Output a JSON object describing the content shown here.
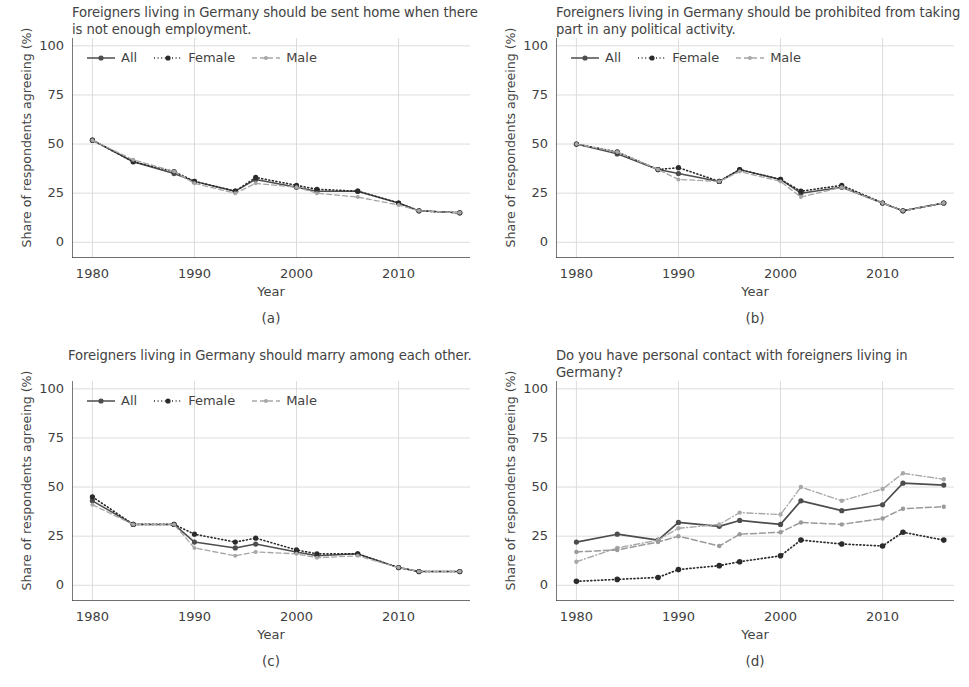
{
  "figure": {
    "y_axis_label": "Share of respondents agreeing (%)",
    "x_axis_label": "Year",
    "y_ticks": [
      "0",
      "25",
      "50",
      "75",
      "100"
    ],
    "x_ticks": [
      "1980",
      "1990",
      "2000",
      "2010"
    ],
    "colors": {
      "all": "#4d4d4d",
      "female": "#2b2b2b",
      "male": "#a6a6a6",
      "workplace": "#4d4d4d",
      "family": "#2b2b2b",
      "friendsgroup": "#a8a8a8",
      "neighborhood": "#9a9a9a",
      "grid": "#d8d8d8",
      "axis": "#404040",
      "text": "#434343"
    }
  },
  "panels": [
    {
      "id": "a",
      "caption": "(a)",
      "title": "Foreigners living in Germany should be sent home when there is not enough employment.",
      "legend": [
        {
          "label": "All",
          "style": "solid",
          "marker": "dot"
        },
        {
          "label": "Female",
          "style": "dotted",
          "marker": "dot"
        },
        {
          "label": "Male",
          "style": "dashed",
          "marker": "dot"
        }
      ]
    },
    {
      "id": "b",
      "caption": "(b)",
      "title": "Foreigners living in Germany should be prohibited from taking part in any political activity.",
      "legend": [
        {
          "label": "All",
          "style": "solid",
          "marker": "dot"
        },
        {
          "label": "Female",
          "style": "dotted",
          "marker": "dot"
        },
        {
          "label": "Male",
          "style": "dashed",
          "marker": "dot"
        }
      ]
    },
    {
      "id": "c",
      "caption": "(c)",
      "title": "Foreigners living in Germany should marry among each other.",
      "legend": [
        {
          "label": "All",
          "style": "solid",
          "marker": "dot"
        },
        {
          "label": "Female",
          "style": "dotted",
          "marker": "dot"
        },
        {
          "label": "Male",
          "style": "dashed",
          "marker": "dot"
        }
      ]
    },
    {
      "id": "d",
      "caption": "(d)",
      "title": "Do you have personal contact with foreigners living in Germany?",
      "legend": [
        {
          "label": "At the Workplace",
          "style": "solid",
          "marker": "dot"
        },
        {
          "label": "In the Family",
          "style": "dotted",
          "marker": "dot"
        },
        {
          "label": "In the Friendsgroup",
          "style": "dashdot",
          "marker": "dot"
        },
        {
          "label": "In the Neighborhood",
          "style": "dashed",
          "marker": "dot"
        }
      ]
    }
  ],
  "chart_data": [
    {
      "type": "line",
      "panel": "a",
      "title": "Foreigners living in Germany should be sent home when there is not enough employment.",
      "xlabel": "Year",
      "ylabel": "Share of respondents agreeing (%)",
      "xlim": [
        1978,
        2017
      ],
      "ylim": [
        -8,
        104
      ],
      "yticks": [
        0,
        25,
        50,
        75,
        100
      ],
      "xticks": [
        1980,
        1990,
        2000,
        2010
      ],
      "grid": true,
      "legend_position": "top-left",
      "x": [
        1980,
        1984,
        1988,
        1990,
        1994,
        1996,
        2000,
        2002,
        2006,
        2010,
        2012,
        2016
      ],
      "series": [
        {
          "name": "All",
          "values": [
            52,
            41,
            35,
            31,
            26,
            32,
            28,
            26,
            26,
            20,
            16,
            15
          ]
        },
        {
          "name": "Female",
          "values": [
            52,
            41,
            36,
            31,
            26,
            33,
            29,
            27,
            26,
            20,
            16,
            15
          ]
        },
        {
          "name": "Male",
          "values": [
            52,
            42,
            36,
            30,
            25,
            30,
            28,
            25,
            23,
            19,
            16,
            15
          ]
        }
      ]
    },
    {
      "type": "line",
      "panel": "b",
      "title": "Foreigners living in Germany should be prohibited from taking part in any political activity.",
      "xlabel": "Year",
      "ylabel": "Share of respondents agreeing (%)",
      "xlim": [
        1978,
        2017
      ],
      "ylim": [
        -8,
        104
      ],
      "yticks": [
        0,
        25,
        50,
        75,
        100
      ],
      "xticks": [
        1980,
        1990,
        2000,
        2010
      ],
      "grid": true,
      "legend_position": "top-left",
      "x": [
        1980,
        1984,
        1988,
        1990,
        1994,
        1996,
        2000,
        2002,
        2006,
        2010,
        2012,
        2016
      ],
      "series": [
        {
          "name": "All",
          "values": [
            50,
            45,
            37,
            35,
            31,
            37,
            32,
            25,
            28,
            20,
            16,
            20
          ]
        },
        {
          "name": "Female",
          "values": [
            50,
            46,
            37,
            38,
            31,
            37,
            32,
            26,
            29,
            20,
            16,
            20
          ]
        },
        {
          "name": "Male",
          "values": [
            50,
            46,
            37,
            32,
            31,
            36,
            31,
            23,
            28,
            20,
            16,
            20
          ]
        }
      ]
    },
    {
      "type": "line",
      "panel": "c",
      "title": "Foreigners living in Germany should marry among each other.",
      "xlabel": "Year",
      "ylabel": "Share of respondents agreeing (%)",
      "xlim": [
        1978,
        2017
      ],
      "ylim": [
        -8,
        104
      ],
      "yticks": [
        0,
        25,
        50,
        75,
        100
      ],
      "xticks": [
        1980,
        1990,
        2000,
        2010
      ],
      "grid": true,
      "legend_position": "top-left",
      "x": [
        1980,
        1984,
        1988,
        1990,
        1994,
        1996,
        2000,
        2002,
        2006,
        2010,
        2012,
        2016
      ],
      "series": [
        {
          "name": "All",
          "values": [
            43,
            31,
            31,
            22,
            19,
            21,
            17,
            15,
            16,
            9,
            7,
            7
          ]
        },
        {
          "name": "Female",
          "values": [
            45,
            31,
            31,
            26,
            22,
            24,
            18,
            16,
            16,
            9,
            7,
            7
          ]
        },
        {
          "name": "Male",
          "values": [
            41,
            31,
            31,
            19,
            15,
            17,
            16,
            14,
            15,
            9,
            7,
            7
          ]
        }
      ]
    },
    {
      "type": "line",
      "panel": "d",
      "title": "Do you have personal contact with foreigners living in Germany?",
      "xlabel": "Year",
      "ylabel": "Share of respondents agreeing (%)",
      "xlim": [
        1978,
        2017
      ],
      "ylim": [
        -8,
        104
      ],
      "yticks": [
        0,
        25,
        50,
        75,
        100
      ],
      "xticks": [
        1980,
        1990,
        2000,
        2010
      ],
      "grid": true,
      "legend_position": "top-left",
      "x": [
        1980,
        1984,
        1988,
        1990,
        1994,
        1996,
        2000,
        2002,
        2006,
        2010,
        2012,
        2016
      ],
      "series": [
        {
          "name": "At the Workplace",
          "values": [
            22,
            26,
            23,
            32,
            30,
            33,
            31,
            43,
            38,
            41,
            52,
            51
          ]
        },
        {
          "name": "In the Family",
          "values": [
            2,
            3,
            4,
            8,
            10,
            12,
            15,
            23,
            21,
            20,
            27,
            23
          ]
        },
        {
          "name": "In the Friendsgroup",
          "values": [
            12,
            19,
            23,
            29,
            31,
            37,
            36,
            50,
            43,
            49,
            57,
            54
          ]
        },
        {
          "name": "In the Neighborhood",
          "values": [
            17,
            18,
            22,
            25,
            20,
            26,
            27,
            32,
            31,
            34,
            39,
            40
          ]
        }
      ]
    }
  ]
}
